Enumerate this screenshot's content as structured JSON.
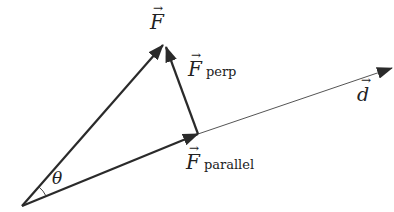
{
  "diagram": {
    "labels": {
      "force": "F",
      "force_arrow": "→",
      "perp_symbol": "F",
      "perp_subscript": "perp",
      "parallel_symbol": "F",
      "parallel_subscript": "parallel",
      "angle": "θ",
      "displacement": "d",
      "displacement_arrow": "→"
    },
    "points": {
      "origin": [
        22,
        206
      ],
      "force_tip": [
        163,
        45
      ],
      "parallel_tip": [
        198,
        134
      ],
      "displacement_tip": [
        392,
        68
      ]
    },
    "colors": {
      "vector": "#2a2a2a",
      "line": "#444444",
      "background": "#ffffff"
    }
  }
}
